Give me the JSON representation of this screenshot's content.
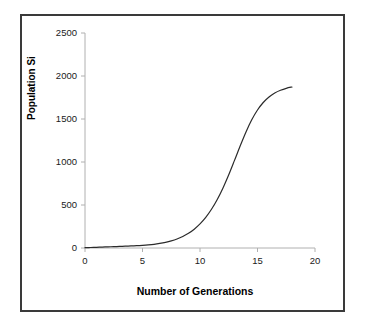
{
  "figure": {
    "border_color": "#3a3a3a",
    "background": "#ffffff"
  },
  "chart_data": {
    "type": "line",
    "title": "",
    "xlabel": "Number of Generations",
    "ylabel": "Population Si",
    "xlim": [
      0,
      20
    ],
    "ylim": [
      0,
      2500
    ],
    "xticks": [
      0,
      5,
      10,
      15,
      20
    ],
    "yticks": [
      0,
      500,
      1000,
      1500,
      2000,
      2500
    ],
    "xtick_labels": [
      "0",
      "5",
      "10",
      "15",
      "20"
    ],
    "ytick_labels": [
      "0",
      "500",
      "1000",
      "1500",
      "2000",
      "2500"
    ],
    "grid": false,
    "legend": null,
    "series": [
      {
        "name": "Population growth",
        "color": "#2b2b2b",
        "line_width": 1.2,
        "marker": "none",
        "curve_model": "logistic",
        "carrying_capacity": 1950,
        "inflection_x": 12.3,
        "growth_rate": 1.05,
        "x": [
          0,
          0.5,
          1,
          1.5,
          2,
          2.5,
          3,
          3.5,
          4,
          4.5,
          5,
          5.5,
          6,
          6.5,
          7,
          7.5,
          8,
          8.5,
          9,
          9.5,
          10,
          10.5,
          11,
          11.5,
          12,
          12.5,
          13,
          13.5,
          14,
          14.5,
          15,
          15.5,
          16,
          16.5,
          17,
          17.5,
          18
        ],
        "y": [
          4,
          6,
          8,
          11,
          13,
          16,
          18,
          21,
          24,
          27,
          31,
          36,
          43,
          53,
          66,
          83,
          105,
          134,
          171,
          219,
          280,
          356,
          450,
          564,
          699,
          852,
          1019,
          1189,
          1350,
          1491,
          1605,
          1692,
          1756,
          1802,
          1834,
          1857,
          1872
        ]
      }
    ],
    "axis_color": "#b0b0b0",
    "tick_color": "#b0b0b0",
    "curve_notes": "S-shaped logistic growth; flat near zero until generation ~8, steep rise between 10 and 14, plateau near 1950 by generation 16-18"
  },
  "axes": {
    "x_title": "Number of Generations",
    "y_title": "Population Si"
  }
}
